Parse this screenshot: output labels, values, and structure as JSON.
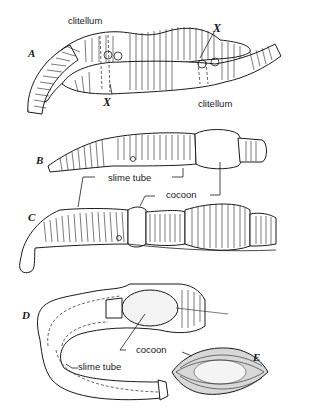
{
  "figure": {
    "panels": [
      {
        "id": "A",
        "letter": "A",
        "labels": {
          "clitellum_top": "clitellum",
          "clitellum_bottom": "clitellum",
          "x_top": "X",
          "x_bottom": "X"
        }
      },
      {
        "id": "B",
        "letter": "B"
      },
      {
        "id": "C",
        "letter": "C",
        "labels": {
          "slime_tube": "slime tube",
          "cocoon": "cocoon"
        }
      },
      {
        "id": "D",
        "letter": "D",
        "labels": {
          "cocoon": "cocoon",
          "slime_tube": "slime tube"
        }
      },
      {
        "id": "E",
        "letter": "E"
      }
    ]
  }
}
